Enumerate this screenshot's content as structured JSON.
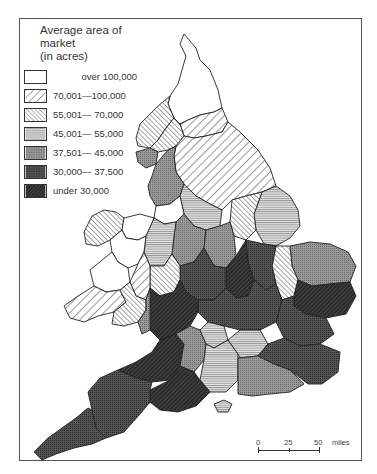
{
  "legend": {
    "title_line1": "Average area of market",
    "title_line2": "(in acres)",
    "items": [
      {
        "label": "over 100,000",
        "pattern": "white"
      },
      {
        "label": "70,001—100,000",
        "pattern": "wide-diagonal"
      },
      {
        "label": "55,001— 70,000",
        "pattern": "fine-diagonal"
      },
      {
        "label": "45,001— 55,000",
        "pattern": "horizontal-lines"
      },
      {
        "label": "37,501— 45,000",
        "pattern": "grey-crosshatch"
      },
      {
        "label": "30,000— 37,500",
        "pattern": "dark-crosshatch"
      },
      {
        "label": "under 30,000",
        "pattern": "black-diagonal"
      }
    ]
  },
  "scale": {
    "ticks": [
      "0",
      "25",
      "50"
    ],
    "unit": "miles"
  },
  "colors": {
    "frame": "#555555",
    "outline": "#222222",
    "grey": "#8a8a8a",
    "dark": "#4a4a4a",
    "black": "#2a2a2a"
  }
}
